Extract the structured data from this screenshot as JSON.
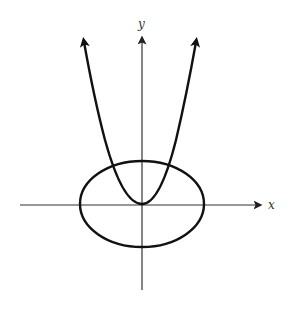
{
  "figure": {
    "colors": {
      "background": "#ffffff",
      "stroke": "#111111",
      "axis": "#333333"
    }
  },
  "axes": {
    "x_label": "x",
    "y_label": "y"
  },
  "curves": [
    {
      "name": "parabola",
      "type": "parabola",
      "vertex": "origin",
      "opens": "up",
      "arrows": "both ends"
    },
    {
      "name": "ellipse",
      "type": "ellipse",
      "center": "origin",
      "orientation": "horizontal major axis"
    }
  ]
}
